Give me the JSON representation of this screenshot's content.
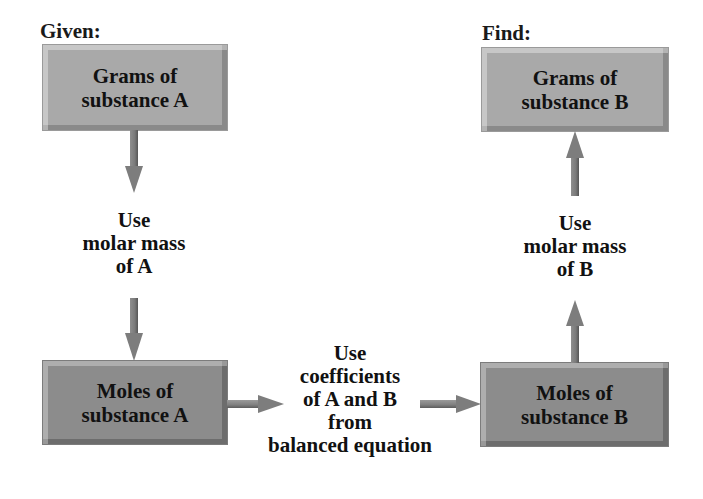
{
  "diagram": {
    "given_label": "Given:",
    "find_label": "Find:",
    "boxes": {
      "grams_a": "Grams of\nsubstance A",
      "moles_a": "Moles of\nsubstance A",
      "moles_b": "Moles of\nsubstance B",
      "grams_b": "Grams of\nsubstance B"
    },
    "steps": {
      "molar_mass_a": "Use\nmolar mass\nof A",
      "coefficients": "Use\ncoefficients\nof A and B\nfrom\nbalanced equation",
      "molar_mass_b": "Use\nmolar mass\nof B"
    },
    "colors": {
      "light_box": "#a9a9a9",
      "dark_box": "#8c8c8c",
      "arrow": "#7d7d7d",
      "text": "#111111"
    },
    "flow": [
      {
        "from": "grams_a",
        "to": "moles_a",
        "via": "molar_mass_a"
      },
      {
        "from": "moles_a",
        "to": "moles_b",
        "via": "coefficients"
      },
      {
        "from": "moles_b",
        "to": "grams_b",
        "via": "molar_mass_b"
      }
    ]
  }
}
